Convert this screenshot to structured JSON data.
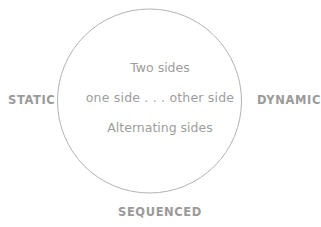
{
  "diagram": {
    "type": "circle-continuum",
    "title_present": false,
    "background_color": "#ffffff",
    "circle": {
      "stroke_color": "#b3b3b3",
      "stroke_width": 1,
      "center_x": 149.5,
      "center_y": 101,
      "radius": 92,
      "fill": "none"
    },
    "axis_labels": {
      "left": "STATIC",
      "right": "DYNAMIC",
      "bottom": "SEQUENCED",
      "color": "#9a9a9a"
    },
    "inner_lines": [
      "Two sides",
      "one side . . . other side",
      "Alternating sides"
    ],
    "inner_text_color": "#9d9d9d"
  }
}
